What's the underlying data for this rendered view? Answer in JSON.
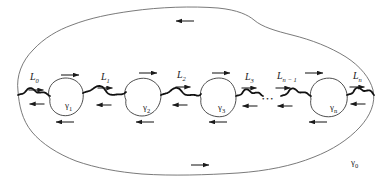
{
  "figure": {
    "background_color": "#ffffff",
    "outer_curve_color": "#6b6b6b",
    "inner_curve_color": "#3a3a3a",
    "cut_line_color": "#111111",
    "arrow_color": "#1a1a1a",
    "label_color": "#1a1a1a",
    "width": 391,
    "height": 189
  },
  "labels": {
    "cuts": [
      {
        "name": "L0",
        "base": "L",
        "sub": "0",
        "x": 30,
        "y": 72
      },
      {
        "name": "L1",
        "base": "L",
        "sub": "1",
        "x": 101,
        "y": 72
      },
      {
        "name": "L2",
        "base": "L",
        "sub": "2",
        "x": 177,
        "y": 70
      },
      {
        "name": "L3",
        "base": "L",
        "sub": "3",
        "x": 245,
        "y": 72
      },
      {
        "name": "Ln-1",
        "base": "L",
        "sub": "n − 1",
        "x": 277,
        "y": 71
      },
      {
        "name": "Ln",
        "base": "L",
        "sub": "n",
        "x": 353,
        "y": 71
      }
    ],
    "inner_contours": [
      {
        "name": "gamma1",
        "base": "γ",
        "sub": "1",
        "x": 65,
        "y": 101
      },
      {
        "name": "gamma2",
        "base": "γ",
        "sub": "2",
        "x": 143,
        "y": 103
      },
      {
        "name": "gamma3",
        "base": "γ",
        "sub": "3",
        "x": 218,
        "y": 103
      },
      {
        "name": "gamman",
        "base": "γ",
        "sub": "n",
        "x": 330,
        "y": 103
      }
    ],
    "outer_contour": {
      "name": "gamma0",
      "base": "γ",
      "sub": "0",
      "x": 351,
      "y": 158
    },
    "ellipsis": "• • •"
  },
  "arrows": {
    "outer_top": [
      {
        "name": "outer-top-arrow-1",
        "x": 185,
        "y": 21,
        "dir": "left"
      }
    ],
    "outer_bottom": [
      {
        "name": "outer-bottom-arrow-1",
        "x": 200,
        "y": 165,
        "dir": "right"
      }
    ],
    "upper_band": [
      {
        "name": "upper-arrow-1",
        "x": 70,
        "y": 75,
        "dir": "right"
      },
      {
        "name": "upper-arrow-2",
        "x": 148,
        "y": 73,
        "dir": "right"
      },
      {
        "name": "upper-arrow-3",
        "x": 221,
        "y": 73,
        "dir": "right"
      },
      {
        "name": "upper-arrow-4",
        "x": 314,
        "y": 73,
        "dir": "right"
      }
    ],
    "cut_upper": [
      {
        "name": "cut-L0-arrow",
        "x": 36,
        "y": 90,
        "dir": "right"
      },
      {
        "name": "cut-L1-arrow",
        "x": 105,
        "y": 88,
        "dir": "right"
      },
      {
        "name": "cut-L2-arrow",
        "x": 183,
        "y": 87,
        "dir": "right"
      },
      {
        "name": "cut-L3-arrow",
        "x": 249,
        "y": 88,
        "dir": "right"
      },
      {
        "name": "cut-Ln1-arrow",
        "x": 283,
        "y": 88,
        "dir": "right"
      },
      {
        "name": "cut-Ln-arrow",
        "x": 357,
        "y": 87,
        "dir": "right"
      }
    ],
    "cut_lower": [
      {
        "name": "cut-L0-back-arrow",
        "x": 37,
        "y": 104,
        "dir": "left"
      },
      {
        "name": "cut-L1-back-arrow",
        "x": 104,
        "y": 105,
        "dir": "left"
      },
      {
        "name": "cut-L2-back-arrow",
        "x": 180,
        "y": 105,
        "dir": "left"
      },
      {
        "name": "cut-L3-back-arrow",
        "x": 250,
        "y": 106,
        "dir": "left"
      },
      {
        "name": "cut-Ln1-back-arrow",
        "x": 285,
        "y": 106,
        "dir": "left"
      },
      {
        "name": "cut-Ln-back-arrow",
        "x": 358,
        "y": 104,
        "dir": "left"
      }
    ],
    "lower_band": [
      {
        "name": "lower-arrow-1",
        "x": 65,
        "y": 122,
        "dir": "left"
      },
      {
        "name": "lower-arrow-2",
        "x": 145,
        "y": 122,
        "dir": "left"
      },
      {
        "name": "lower-arrow-3",
        "x": 218,
        "y": 122,
        "dir": "left"
      },
      {
        "name": "lower-arrow-4",
        "x": 318,
        "y": 122,
        "dir": "left"
      }
    ]
  },
  "geometry": {
    "outer_boundary_path": "M 18,91 C 16,76 22,61 33,50 C 44,38 58,30 72,25 C 90,18 110,14 132,11 C 160,7 192,6 218,8 C 238,10 248,15 254,20 C 262,27 276,31 292,35 C 312,40 330,47 346,57 C 360,66 370,78 373,90 C 376,103 370,116 360,127 C 348,140 332,150 314,157 C 292,166 266,171 238,173 C 206,175 172,176 142,174 C 118,172 96,168 76,161 C 58,154 42,144 32,132 C 22,120 19,105 18,91 Z",
    "inner_blobs": [
      "M 50,99 C 47,93 49,86 54,82 C 59,78 66,77 72,79 C 78,81 82,86 83,92 C 84,99 82,106 77,111 C 72,116 64,117 58,114 C 52,111 49,105 50,99 Z",
      "M 126,100 C 123,94 125,86 131,82 C 137,78 145,77 151,80 C 157,83 161,88 161,95 C 161,102 158,109 152,113 C 146,117 138,117 132,113 C 127,110 125,105 126,100 Z",
      "M 201,99 C 199,92 202,85 208,81 C 215,77 223,77 229,81 C 234,85 236,91 236,98 C 236,105 233,111 227,115 C 221,118 213,117 207,113 C 202,109 200,104 201,99 Z",
      "M 311,99 C 309,92 312,85 318,81 C 325,77 334,77 340,82 C 346,87 348,94 347,101 C 346,108 341,114 334,116 C 327,118 319,116 314,111 C 311,108 310,103 311,99 Z"
    ],
    "cut_segments": [
      "M 18,95 C 24,92 29,89 35,90 C 41,91 45,94 50,96",
      "M 83,93 C 89,90 94,87 100,88 C 106,89 111,94 117,95 C 122,96 124,94 126,92",
      "M 161,95 C 167,92 172,89 178,90 C 184,91 189,95 195,96 C 199,97 200,95 201,94",
      "M 236,96 C 242,93 246,90 252,91 C 257,92 260,95 263,96",
      "M 281,96 C 287,93 292,89 298,90 C 303,91 307,95 311,96",
      "M 347,95 C 353,92 358,88 364,89 C 369,90 372,93 374,95"
    ]
  }
}
